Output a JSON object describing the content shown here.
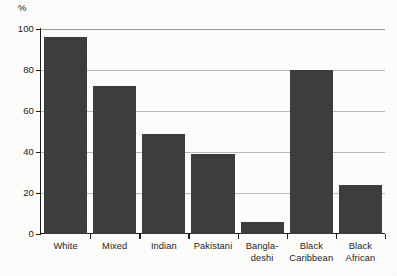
{
  "chart_data": {
    "type": "bar",
    "title": "",
    "subtitle": "",
    "xlabel": "",
    "ylabel": "",
    "unit_label": "%",
    "categories": [
      "White",
      "Mixed",
      "Indian",
      "Pakistani",
      "Bangla-deshi",
      "Black Caribbean",
      "Black African"
    ],
    "category_lines": [
      [
        "White"
      ],
      [
        "Mixed"
      ],
      [
        "Indian"
      ],
      [
        "Pakistani"
      ],
      [
        "Bangla-",
        "deshi"
      ],
      [
        "Black",
        "Caribbean"
      ],
      [
        "Black",
        "African"
      ]
    ],
    "values": [
      96,
      72,
      49,
      39,
      6,
      80,
      24
    ],
    "ylim": [
      0,
      100
    ],
    "yticks": [
      0,
      20,
      40,
      60,
      80,
      100
    ],
    "ytick_labels": [
      "0",
      "20",
      "40",
      "60",
      "80",
      "100"
    ],
    "grid": true,
    "grid_axis": "y",
    "legend": false,
    "legend_position": "none",
    "bar_color": "#3d3d3d",
    "grid_color": "#b9b9b9",
    "axis_color": "#1d1d1d",
    "background_color": "#fdfdfc"
  }
}
